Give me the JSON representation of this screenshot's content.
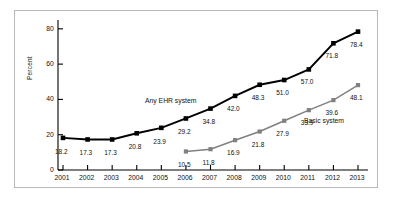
{
  "chart_data": {
    "type": "line",
    "title": "",
    "subtitle": "",
    "xlabel": "",
    "ylabel": "Percent",
    "categories": [
      "2001",
      "2002",
      "2003",
      "2004",
      "2005",
      "2006",
      "2007",
      "2008",
      "2009",
      "2010",
      "2011",
      "2012",
      "2013"
    ],
    "x": [
      2001,
      2002,
      2003,
      2004,
      2005,
      2006,
      2007,
      2008,
      2009,
      2010,
      2011,
      2012,
      2013
    ],
    "ylim": [
      0,
      85
    ],
    "yticks": [
      0,
      20,
      40,
      60,
      80
    ],
    "ytick_labels": [
      "0",
      "20",
      "40",
      "60",
      "80"
    ],
    "grid": false,
    "legend_position": "inline-annotation",
    "series": [
      {
        "name": "Any EHR system",
        "color": "#000000",
        "marker": "square",
        "values": [
          18.2,
          17.3,
          17.3,
          20.8,
          23.9,
          29.2,
          34.8,
          42.0,
          48.3,
          51.0,
          57.0,
          71.8,
          78.4
        ],
        "labels": [
          "18.2",
          "17.3",
          "17.3",
          "20.8",
          "23.9",
          "29.2",
          "34.8",
          "42.0",
          "48.3",
          "51.0",
          "57.0",
          "71.8",
          "78.4"
        ]
      },
      {
        "name": "Basic system",
        "color": "#808080",
        "marker": "square",
        "values": [
          null,
          null,
          null,
          null,
          null,
          10.5,
          11.8,
          16.9,
          21.8,
          27.9,
          33.9,
          39.6,
          48.1
        ],
        "labels": [
          "",
          "",
          "",
          "",
          "",
          "10.5",
          "11.8",
          "16.9",
          "21.8",
          "27.9",
          "33.9",
          "39.6",
          "48.1"
        ]
      }
    ],
    "annotations": [
      {
        "text": "Any EHR system",
        "series": "Any EHR system"
      },
      {
        "text": "Basic system",
        "series": "Basic system"
      }
    ]
  }
}
